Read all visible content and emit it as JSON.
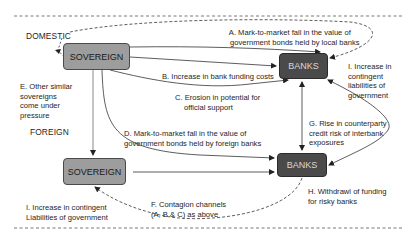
{
  "diagram": {
    "regions": {
      "domestic": "DOMESTIC",
      "foreign": "FOREIGN"
    },
    "nodes": {
      "domestic_sovereign": "SOVEREIGN",
      "domestic_banks": "BANKS",
      "foreign_sovereign": "SOVEREIGN",
      "foreign_banks": "BANKS"
    },
    "labels": {
      "A1": "A. Mark-to-market fall in the value of",
      "A2": "government bonds held by local banks",
      "B": "B. Increase in bank funding costs",
      "C1": "C. Erosion in potential for",
      "C2": "official support",
      "D1": "D. Mark-to-market fall in the value of",
      "D2": "government bonds held by foreign banks",
      "E1": "E. Other similar",
      "E2": "sovereigns",
      "E3": "come under",
      "E4": "pressure",
      "F1": "F. Contagion channels",
      "F2": "(A, B & C) as above",
      "G1": "G. Rise in counterparty",
      "G2": "credit risk of interbank",
      "G3": "exposures",
      "H1": "H. Withdrawl of funding",
      "H2": "for risky banks",
      "I_dom1": "I. Increase in",
      "I_dom2": "contingent",
      "I_dom3": "liabilities of",
      "I_dom4": "government",
      "I_for1": "I. Increase in contingent",
      "I_for2": "Liabilities of government"
    },
    "colors": {
      "sovereign_fill": "#9d9d9d",
      "banks_fill": "#4a4a4a",
      "line": "#333333"
    }
  }
}
